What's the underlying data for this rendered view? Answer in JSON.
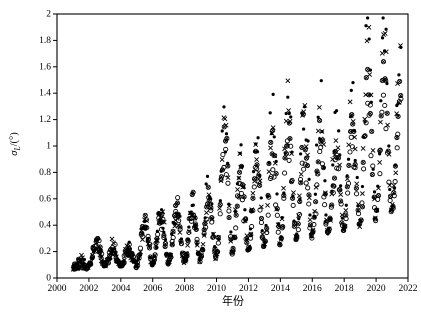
{
  "figure": {
    "background": "#ffffff",
    "frame_color": "#000000",
    "marker_color": "#000000",
    "tick_label_color": "#000000"
  },
  "chart_data": {
    "type": "scatter",
    "title": "",
    "xlabel": "年份",
    "ylabel": "σL/(°)",
    "ylabel_parts": {
      "symbol": "σ",
      "subscript": "L",
      "unit": "/(°)"
    },
    "xlim": [
      2000,
      2022
    ],
    "ylim": [
      0,
      2
    ],
    "x_tick_labels": [
      "2000",
      "2002",
      "2004",
      "2006",
      "2008",
      "2010",
      "2012",
      "2014",
      "2016",
      "2018",
      "2020",
      "2022"
    ],
    "y_tick_labels": [
      "0",
      "0.2",
      "0.4",
      "0.6",
      "0.8",
      "1",
      "1.2",
      "1.4",
      "1.6",
      "1.8",
      "2"
    ],
    "grid": false,
    "legend_position": "none",
    "sampling": "monthly points, annual seasonal cycle with mid-year peak; amplitude grows over time",
    "years": [
      2001,
      2002,
      2003,
      2004,
      2005,
      2006,
      2007,
      2008,
      2009,
      2010,
      2011,
      2012,
      2013,
      2014,
      2015,
      2016,
      2017,
      2018,
      2019,
      2020,
      2021
    ],
    "months_in_last_year": 7,
    "seasonal_profile": [
      0.02,
      0.15,
      0.37,
      0.63,
      0.85,
      0.98,
      0.98,
      0.85,
      0.63,
      0.37,
      0.15,
      0.02
    ],
    "valley_by_year": [
      0.08,
      0.1,
      0.1,
      0.09,
      0.1,
      0.11,
      0.12,
      0.13,
      0.15,
      0.17,
      0.2,
      0.22,
      0.25,
      0.28,
      0.3,
      0.33,
      0.35,
      0.38,
      0.42,
      0.48,
      0.52
    ],
    "series": [
      {
        "name": "series-filled-circle",
        "marker": "filled-circle",
        "peaks_by_year": [
          0.12,
          0.28,
          0.22,
          0.22,
          0.42,
          0.48,
          0.55,
          0.58,
          0.68,
          1.18,
          0.9,
          1.03,
          1.28,
          1.45,
          1.32,
          1.28,
          1.15,
          1.4,
          1.9,
          1.83,
          1.64
        ]
      },
      {
        "name": "series-cross",
        "marker": "cross",
        "peaks_by_year": [
          0.12,
          0.28,
          0.22,
          0.22,
          0.42,
          0.48,
          0.54,
          0.56,
          0.65,
          1.12,
          0.85,
          0.96,
          1.18,
          1.33,
          1.22,
          1.19,
          1.07,
          1.3,
          1.75,
          1.7,
          1.53
        ]
      },
      {
        "name": "series-circle-cross",
        "marker": "circle-cross",
        "peaks_by_year": [
          0.12,
          0.28,
          0.22,
          0.22,
          0.42,
          0.47,
          0.53,
          0.54,
          0.62,
          1.04,
          0.78,
          0.87,
          1.05,
          1.19,
          1.1,
          1.07,
          0.97,
          1.18,
          1.57,
          1.53,
          1.39
        ]
      },
      {
        "name": "series-open-circle",
        "marker": "open-circle",
        "peaks_by_year": [
          0.12,
          0.28,
          0.22,
          0.22,
          0.42,
          0.46,
          0.51,
          0.52,
          0.58,
          0.94,
          0.7,
          0.76,
          0.89,
          1.01,
          0.93,
          0.92,
          0.85,
          1.01,
          1.34,
          1.32,
          1.21
        ]
      }
    ],
    "noise": {
      "seasonal_amplitude": 0.22,
      "y_amplitude": 0.04,
      "x_amplitude": 0.03
    }
  }
}
